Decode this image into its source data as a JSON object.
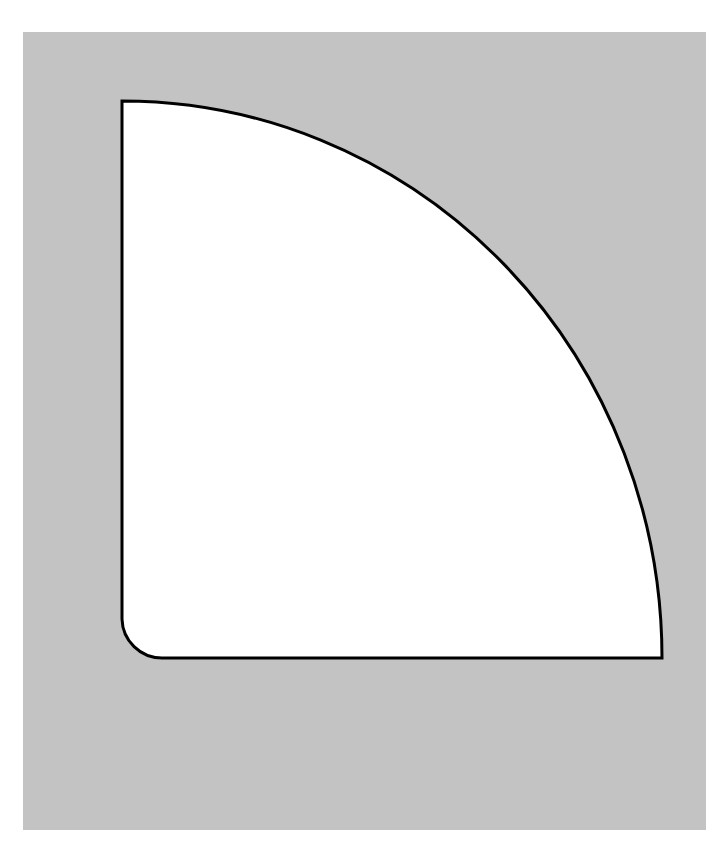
{
  "page": {
    "width": 728,
    "height": 859,
    "background_color": "#ffffff"
  },
  "panel": {
    "name": "gray-background-panel",
    "fill_color": "#c3c3c3",
    "x": 23,
    "y": 32,
    "width": 683,
    "height": 798
  },
  "shape": {
    "name": "quarter-round-outline",
    "fill_color": "#ffffff",
    "stroke_color": "#000000",
    "stroke_width": 3,
    "description": "Quarter ellipse region: vertical straight left edge, horizontal straight bottom edge, convex elliptical arc from top-left to bottom-right, and a small concave fillet arc at the bottom-left corner.",
    "geometry": {
      "corner_x": 122,
      "corner_y": 658,
      "top_y": 101,
      "right_x": 662,
      "semi_axis_x": 540,
      "semi_axis_y": 557,
      "fillet_radius": 40,
      "fillet_start_x": 122,
      "fillet_start_y": 619,
      "fillet_end_x": 162,
      "fillet_end_y": 658
    },
    "path": "M 122 101 A 540 557 0 0 1 662 658 L 162 658 A 40 40 0 0 1 122 619 Z",
    "vertices": [
      {
        "name": "top-left-corner",
        "x": 122,
        "y": 101
      },
      {
        "name": "bottom-right-corner",
        "x": 662,
        "y": 658
      },
      {
        "name": "fillet-bottom-end",
        "x": 162,
        "y": 658
      },
      {
        "name": "fillet-left-start",
        "x": 122,
        "y": 619
      }
    ]
  }
}
